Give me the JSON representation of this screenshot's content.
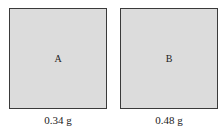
{
  "samples": [
    {
      "label": "A",
      "mass": "0.34 g"
    },
    {
      "label": "B",
      "mass": "0.48 g"
    }
  ],
  "colors": {
    "fill": "#dcdcdc",
    "border": "#3a3a3a"
  }
}
